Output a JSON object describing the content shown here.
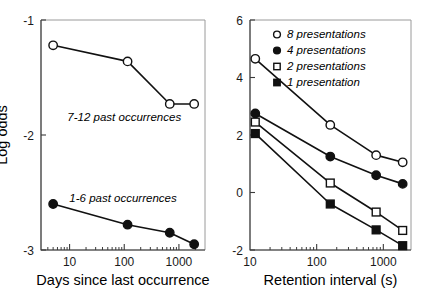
{
  "figure": {
    "background": "#ffffff",
    "line_color": "#111111",
    "axis_color": "#3b3b3b"
  },
  "chart_data": [
    {
      "id": "left-panel",
      "type": "line",
      "title": "",
      "xlabel": "Days since last occurrence",
      "ylabel": "Log odds",
      "xscale": "log",
      "xlim": [
        3,
        3000
      ],
      "ylim": [
        -3,
        -1
      ],
      "yticks": [
        -1,
        -2,
        -3
      ],
      "ytick_labels": [
        "-1",
        "-2",
        "-3"
      ],
      "xticks": [
        10,
        100,
        1000
      ],
      "xtick_labels": [
        "10",
        "100",
        "1000"
      ],
      "grid": false,
      "legend": "inline-annotations",
      "series": [
        {
          "name": "7-12 past occurrences",
          "marker": "open-circle",
          "x": [
            5,
            115,
            680,
            1900
          ],
          "values": [
            -1.22,
            -1.36,
            -1.73,
            -1.73
          ]
        },
        {
          "name": "1-6 past occurrences",
          "marker": "filled-circle",
          "x": [
            5,
            115,
            680,
            1900
          ],
          "values": [
            -2.6,
            -2.78,
            -2.85,
            -2.95
          ]
        }
      ],
      "annotations": [
        {
          "text": "7-12 past occurrences",
          "x": 100,
          "y": -1.88
        },
        {
          "text": "1-6 past occurrences",
          "x": 95,
          "y": -2.58
        }
      ]
    },
    {
      "id": "right-panel",
      "type": "line",
      "title": "",
      "xlabel": "Retention interval (s)",
      "ylabel": "",
      "xscale": "log",
      "xlim": [
        10,
        2600
      ],
      "ylim": [
        -2,
        6
      ],
      "yticks": [
        6,
        4,
        2,
        0,
        -2
      ],
      "ytick_labels": [
        "6",
        "4",
        "2",
        "0",
        "-2"
      ],
      "xticks": [
        10,
        100,
        1000
      ],
      "xtick_labels": [
        "10",
        "100",
        "1000"
      ],
      "grid": false,
      "legend_position": "top-right",
      "series": [
        {
          "name": "8 presentations",
          "marker": "open-circle",
          "x": [
            12,
            160,
            780,
            1950
          ],
          "values": [
            4.65,
            2.35,
            1.3,
            1.05
          ]
        },
        {
          "name": "4 presentations",
          "marker": "filled-circle",
          "x": [
            12,
            160,
            780,
            1950
          ],
          "values": [
            2.75,
            1.25,
            0.6,
            0.3
          ]
        },
        {
          "name": "2 presentations",
          "marker": "open-square",
          "x": [
            12,
            160,
            780,
            1950
          ],
          "values": [
            2.45,
            0.33,
            -0.68,
            -1.32
          ]
        },
        {
          "name": "1 presentation",
          "marker": "filled-square",
          "x": [
            12,
            160,
            780,
            1950
          ],
          "values": [
            2.05,
            -0.4,
            -1.3,
            -1.85
          ]
        }
      ],
      "legend_items": [
        {
          "label": "8 presentations",
          "marker": "open-circle"
        },
        {
          "label": "4 presentations",
          "marker": "filled-circle"
        },
        {
          "label": "2 presentations",
          "marker": "open-square"
        },
        {
          "label": "1 presentation",
          "marker": "filled-square"
        }
      ]
    }
  ]
}
